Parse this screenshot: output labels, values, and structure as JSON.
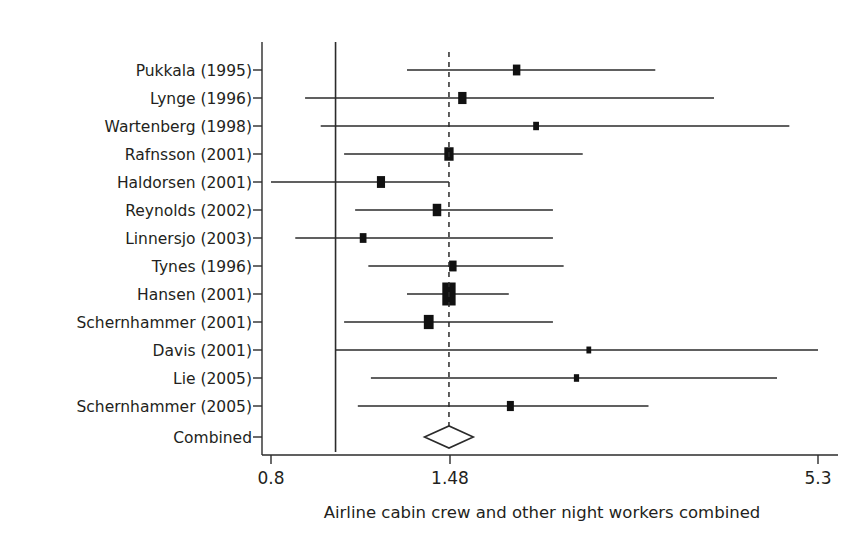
{
  "chart_data": {
    "type": "forest",
    "title": "",
    "xlabel": "Airline cabin crew and other night workers combined",
    "ylabel": "",
    "scale": "log",
    "xlim": [
      0.8,
      5.3
    ],
    "xticks": [
      0.8,
      1.48,
      5.3
    ],
    "xtick_labels": [
      "0.8",
      "1.48",
      "5.3"
    ],
    "null_value": 1.0,
    "pooled_value": 1.48,
    "pooled_label": "Combined",
    "grid": false,
    "legend": "none",
    "categories": [
      "Pukkala (1995)",
      "Lynge (1996)",
      "Wartenberg (1998)",
      "Rafnsson (2001)",
      "Haldorsen (2001)",
      "Reynolds (2002)",
      "Linnersjo (2003)",
      "Tynes (1996)",
      "Hansen (2001)",
      "Schernhammer (2001)",
      "Davis (2001)",
      "Lie (2005)",
      "Schernhammer (2005)"
    ],
    "studies": [
      {
        "label": "Pukkala (1995)",
        "estimate": 1.87,
        "ci_low": 1.28,
        "ci_high": 3.02,
        "weight": 0.22
      },
      {
        "label": "Lynge (1996)",
        "estimate": 1.55,
        "ci_low": 0.9,
        "ci_high": 3.7,
        "weight": 0.3
      },
      {
        "label": "Wartenberg (1998)",
        "estimate": 2.0,
        "ci_low": 0.95,
        "ci_high": 4.8,
        "weight": 0.1
      },
      {
        "label": "Rafnsson (2001)",
        "estimate": 1.48,
        "ci_low": 1.03,
        "ci_high": 2.35,
        "weight": 0.4
      },
      {
        "label": "Haldorsen (2001)",
        "estimate": 1.17,
        "ci_low": 0.8,
        "ci_high": 1.48,
        "weight": 0.28
      },
      {
        "label": "Reynolds (2002)",
        "estimate": 1.42,
        "ci_low": 1.07,
        "ci_high": 2.12,
        "weight": 0.32
      },
      {
        "label": "Linnersjo (2003)",
        "estimate": 1.1,
        "ci_low": 0.87,
        "ci_high": 2.12,
        "weight": 0.16
      },
      {
        "label": "Tynes (1996)",
        "estimate": 1.5,
        "ci_low": 1.12,
        "ci_high": 2.2,
        "weight": 0.22
      },
      {
        "label": "Hansen (2001)",
        "estimate": 1.48,
        "ci_low": 1.28,
        "ci_high": 1.82,
        "weight": 1.0
      },
      {
        "label": "Schernhammer (2001)",
        "estimate": 1.38,
        "ci_low": 1.03,
        "ci_high": 2.12,
        "weight": 0.46
      },
      {
        "label": "Davis (2001)",
        "estimate": 2.4,
        "ci_low": 1.0,
        "ci_high": 5.3,
        "weight": 0.05
      },
      {
        "label": "Lie (2005)",
        "estimate": 2.3,
        "ci_low": 1.13,
        "ci_high": 4.6,
        "weight": 0.07
      },
      {
        "label": "Schernhammer (2005)",
        "estimate": 1.83,
        "ci_low": 1.08,
        "ci_high": 2.95,
        "weight": 0.18
      }
    ],
    "combined": {
      "label": "Combined",
      "estimate": 1.48,
      "ci_low": 1.36,
      "ci_high": 1.61
    },
    "colors": {
      "ink": "#231f20",
      "marker": "#111111",
      "rule": "#2b2b2b",
      "background": "#ffffff"
    }
  }
}
